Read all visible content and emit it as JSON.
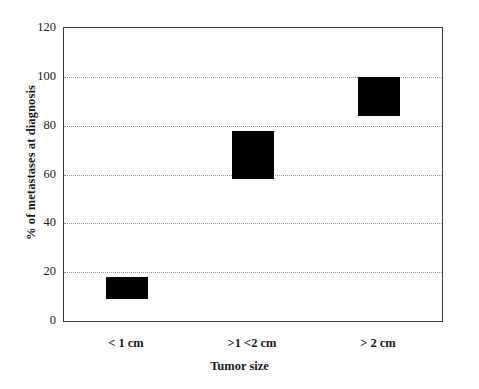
{
  "chart_data": {
    "type": "bar",
    "title": "",
    "subtitle": "",
    "xlabel": "Tumor size",
    "ylabel": "% of metastases at diagnosis",
    "categories": [
      "< 1 cm",
      ">1 <2 cm",
      "> 2 cm"
    ],
    "bar_style": "floating-range",
    "ranges": [
      {
        "category": "< 1 cm",
        "low": 9,
        "high": 18
      },
      {
        "category": ">1 <2 cm",
        "low": 58,
        "high": 78
      },
      {
        "category": "> 2 cm",
        "low": 84,
        "high": 100
      }
    ],
    "values": [
      18,
      78,
      100
    ],
    "ylim": [
      0,
      120
    ],
    "ytick_values": [
      0,
      20,
      40,
      60,
      80,
      100,
      120
    ],
    "ytick_labels": [
      "0",
      "20",
      "40",
      "60",
      "80",
      "100",
      "120"
    ],
    "gridlines": [
      20,
      40,
      60,
      80,
      100
    ],
    "grid": true,
    "legend": false,
    "legend_position": "none",
    "bar_color": "#000000",
    "grid_color": "#9a9a9a",
    "axis_color": "#3a3a3a",
    "background": "#ffffff"
  },
  "axes": {
    "y_title": "% of metastases at diagnosis",
    "x_title": "Tumor size",
    "y_ticks": [
      {
        "label": "120",
        "value": 120
      },
      {
        "label": "100",
        "value": 100
      },
      {
        "label": "80",
        "value": 80
      },
      {
        "label": "60",
        "value": 60
      },
      {
        "label": "40",
        "value": 40
      },
      {
        "label": "20",
        "value": 20
      },
      {
        "label": "0",
        "value": 0
      }
    ],
    "x_ticks": [
      {
        "label": "< 1 cm"
      },
      {
        "label": ">1 <2 cm"
      },
      {
        "label": "> 2 cm"
      }
    ]
  }
}
